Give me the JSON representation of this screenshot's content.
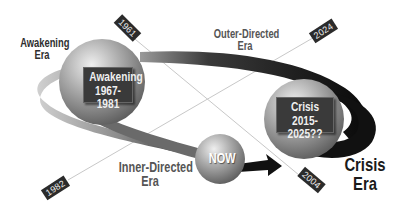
{
  "diagram": {
    "type": "cycle",
    "title": "",
    "spheres": [
      {
        "id": "awakening",
        "line1": "Awakening",
        "line2": "1967-1981"
      },
      {
        "id": "crisis",
        "line1": "Crisis",
        "line2": "2015-2025??"
      },
      {
        "id": "now",
        "label": "NOW"
      }
    ],
    "era_labels": {
      "awakening": {
        "line1": "Awakening",
        "line2": "Era"
      },
      "outer": {
        "line1": "Outer-Directed",
        "line2": "Era"
      },
      "inner": {
        "line1": "Inner-Directed",
        "line2": "Era"
      },
      "crisis": {
        "line1": "Crisis",
        "line2": "Era"
      }
    },
    "year_tags": {
      "y1961": "1961",
      "y2024": "2024",
      "y1982": "1982",
      "y2004": "2004"
    },
    "colors": {
      "ring_dark": "#1a1a1a",
      "ring_light": "#b8b8b8",
      "sphere_light": "#d8d8d8",
      "sphere_dark": "#6e6e6e",
      "tag_bg": "#2b2b2b",
      "box_bg": "#3a3a3a"
    }
  }
}
